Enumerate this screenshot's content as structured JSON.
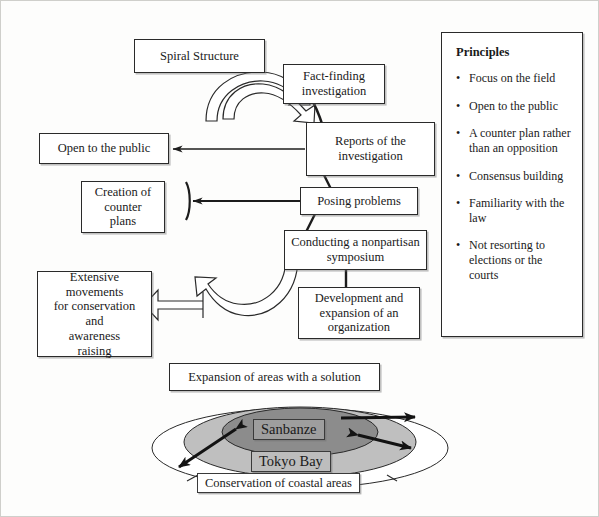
{
  "diagram": {
    "title_box": "Spiral Structure",
    "flow_boxes": [
      {
        "id": "fact-finding",
        "text": "Fact-finding\ninvestigation"
      },
      {
        "id": "reports",
        "text": "Reports of the\ninvestigation"
      },
      {
        "id": "posing-problems",
        "text": "Posing problems"
      },
      {
        "id": "symposium",
        "text": "Conducting a nonpartisan\nsymposium"
      },
      {
        "id": "development",
        "text": "Development and\nexpansion of an\norganization"
      }
    ],
    "output_boxes": [
      {
        "id": "open-public",
        "text": "Open to the public"
      },
      {
        "id": "counter-plans",
        "text": "Creation of\ncounter\nplans"
      },
      {
        "id": "extensive-movements",
        "text": "Extensive\nmovements\nfor conservation\nand\nawareness\nraising"
      }
    ],
    "expansion_box": "Expansion of areas with a solution",
    "geography": {
      "inner_label": "Sanbanze",
      "middle_label": "Tokyo Bay",
      "outer_label": "Conservation of coastal areas",
      "colors": {
        "inner_fill": "#8c8c8c",
        "middle_fill": "#bfbfbf",
        "outer_fill": "#ffffff",
        "stroke": "#2a2a2a"
      }
    }
  },
  "principles": {
    "title": "Principles",
    "bullet_glyph": "•",
    "items": [
      "Focus on the field",
      "Open to the public",
      "A counter plan rather than an opposition",
      "Consensus building",
      "Familiarity with the law",
      "Not resorting to elections or the courts"
    ]
  }
}
